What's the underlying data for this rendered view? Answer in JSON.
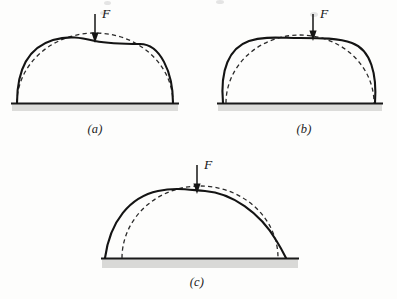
{
  "figure": {
    "background_color": "#fdfdfc",
    "line_color": "#1a1a1a",
    "dashed_color": "#2a2a2a",
    "ground_color": "#1a1a1a",
    "ground_shadow_color": "#d8d8d6"
  },
  "panels": [
    {
      "id": "a",
      "caption": "(a)",
      "force_label": "F",
      "description": "semicircular arch, crown flattens downward under load",
      "ground_span": [
        12,
        178
      ],
      "ground_y": 103,
      "apex_y": 35,
      "solid_curve": "flattened crown, springings unchanged",
      "dashed_curve": "original undeformed semicircle"
    },
    {
      "id": "b",
      "caption": "(b)",
      "force_label": "F",
      "description": "arch crown flattens while haunches bulge outward",
      "ground_span": [
        218,
        382
      ],
      "ground_y": 103,
      "apex_y": 36,
      "solid_curve": "flat crown with outward bulging haunches",
      "dashed_curve": "original undeformed semicircle"
    },
    {
      "id": "c",
      "caption": "(c)",
      "force_label": "F",
      "description": "arch spreads outward, springings displace beyond original base",
      "ground_span": [
        105,
        295
      ],
      "ground_y": 258,
      "apex_y": 192,
      "solid_curve": "spread arch with widened base",
      "dashed_curve": "original undeformed semicircle"
    }
  ],
  "arrow": {
    "name": "downward-force-arrow",
    "direction": "down",
    "label": "F"
  }
}
